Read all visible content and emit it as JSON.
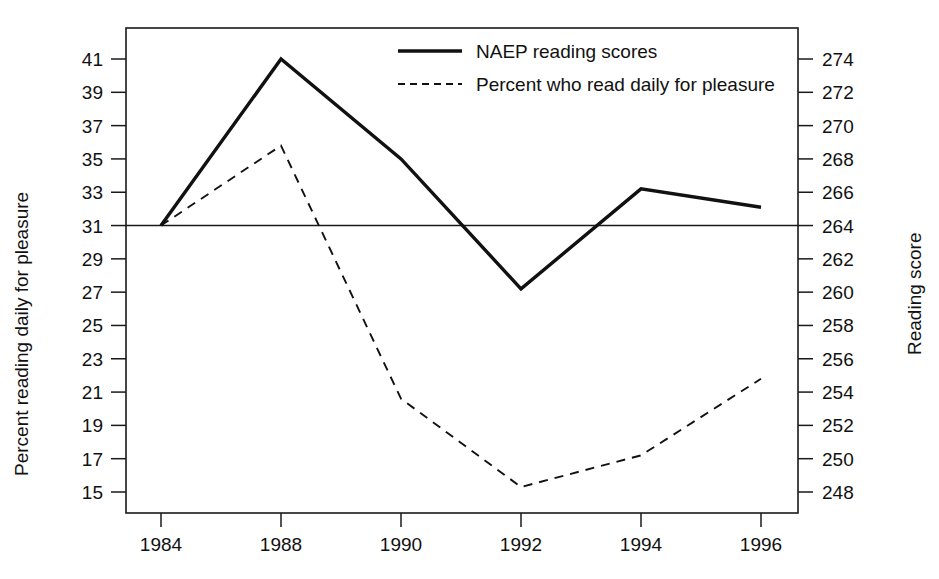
{
  "chart_data": {
    "type": "line",
    "title": "",
    "xlabel": "",
    "categories": [
      "1984",
      "1988",
      "1990",
      "1992",
      "1994",
      "1996"
    ],
    "grid": false,
    "legend_position": "top-right",
    "axes": {
      "left": {
        "label": "Percent reading daily for pleasure",
        "ticks": [
          41,
          39,
          37,
          35,
          33,
          31,
          29,
          27,
          25,
          23,
          21,
          19,
          17,
          15
        ],
        "ylim": [
          15,
          41
        ],
        "step": 2
      },
      "right": {
        "label": "Reading score",
        "ticks": [
          274,
          272,
          270,
          268,
          266,
          264,
          262,
          260,
          258,
          256,
          254,
          252,
          250,
          248
        ],
        "ylim": [
          248,
          274
        ],
        "step": 2
      }
    },
    "reference_line": {
      "left_value": 31,
      "right_value": 264,
      "style": "solid-thin"
    },
    "series": [
      {
        "name": "NAEP reading scores",
        "axis": "right",
        "style": "solid",
        "color": "#111111",
        "values": [
          264.0,
          274.0,
          268.0,
          260.2,
          266.2,
          265.1
        ]
      },
      {
        "name": "Percent who read daily for pleasure",
        "axis": "left",
        "style": "dashed",
        "color": "#111111",
        "values": [
          31.0,
          35.8,
          20.6,
          15.3,
          17.2,
          21.8
        ]
      }
    ],
    "legend": [
      {
        "label": "NAEP reading scores",
        "style": "solid"
      },
      {
        "label": "Percent who read daily for pleasure",
        "style": "dashed"
      }
    ]
  }
}
